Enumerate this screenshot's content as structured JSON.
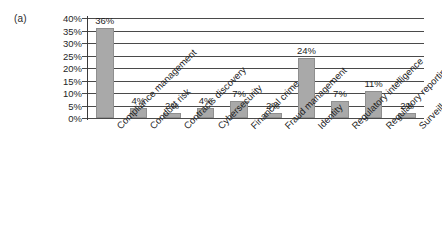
{
  "panel": {
    "marker": "(a)"
  },
  "chart_data": {
    "type": "bar",
    "title": "",
    "subtitle": "",
    "xlabel": "",
    "ylabel": "",
    "ylim": [
      0,
      40
    ],
    "ytick_labels": [
      "40%",
      "35%",
      "30%",
      "25%",
      "20%",
      "15%",
      "10%",
      "5%",
      "0%"
    ],
    "ytick_values": [
      40,
      35,
      30,
      25,
      20,
      15,
      10,
      5,
      0
    ],
    "grid": true,
    "legend": false,
    "legend_position": "none",
    "categories": [
      "Compliance management",
      "Conduct risk",
      "Contracts discovery",
      "Cybersecurity",
      "Financial crime",
      "Fraud management",
      "Identity",
      "Regulatory intelligence",
      "Regulatory reporting",
      "Surveillance"
    ],
    "values": [
      36,
      4,
      2,
      4,
      7,
      2,
      24,
      7,
      11,
      2
    ],
    "data_labels": [
      "36%",
      "4%",
      "2%",
      "4%",
      "7%",
      "2%",
      "24%",
      "7%",
      "11%",
      "2%"
    ],
    "bar_color": "#a9a9a9",
    "bar_edge_color": "#8f8f8f",
    "grid_color": "#4a4a4a",
    "background_color": "#ffffff"
  }
}
